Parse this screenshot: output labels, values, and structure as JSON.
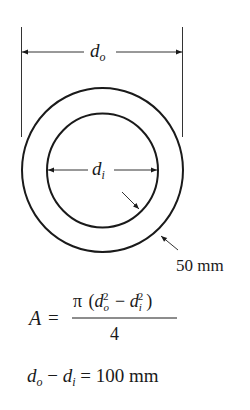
{
  "diagram": {
    "colors": {
      "ink": "#1a1a1a",
      "dim_line": "#333333",
      "background": "#ffffff"
    },
    "outer_diameter_label": {
      "symbol": "d",
      "subscript": "o"
    },
    "inner_diameter_label": {
      "symbol": "d",
      "subscript": "i"
    },
    "wall_thickness_label": "50 mm",
    "area_formula": {
      "lhs": "A",
      "equals": "=",
      "numerator": {
        "pi": "π",
        "open": "(",
        "term1": {
          "symbol": "d",
          "subscript": "o",
          "exponent": "2"
        },
        "minus": "−",
        "term2": {
          "symbol": "d",
          "subscript": "i",
          "exponent": "2"
        },
        "close": ")"
      },
      "denominator": "4"
    },
    "difference_equation": {
      "term1": {
        "symbol": "d",
        "subscript": "o"
      },
      "minus": "−",
      "term2": {
        "symbol": "d",
        "subscript": "i"
      },
      "equals": "=",
      "value": "100 mm"
    }
  }
}
